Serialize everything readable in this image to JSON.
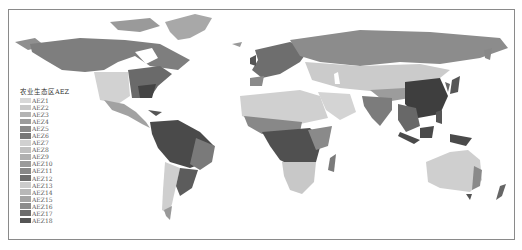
{
  "map": {
    "title": "",
    "type": "world-choropleth",
    "legend": {
      "title": "农业生态区AEZ",
      "items": [
        {
          "label": "AEZ1",
          "color": "#d8d8d8"
        },
        {
          "label": "AEZ2",
          "color": "#c8c8c8"
        },
        {
          "label": "AEZ3",
          "color": "#b4b4b4"
        },
        {
          "label": "AEZ4",
          "color": "#9c9c9c"
        },
        {
          "label": "AEZ5",
          "color": "#8a8a8a"
        },
        {
          "label": "AEZ6",
          "color": "#787878"
        },
        {
          "label": "AEZ7",
          "color": "#d0d0d0"
        },
        {
          "label": "AEZ8",
          "color": "#c0c0c0"
        },
        {
          "label": "AEZ9",
          "color": "#b0b0b0"
        },
        {
          "label": "AEZ10",
          "color": "#9a9a9a"
        },
        {
          "label": "AEZ11",
          "color": "#888888"
        },
        {
          "label": "AEZ12",
          "color": "#6e6e6e"
        },
        {
          "label": "AEZ13",
          "color": "#cccccc"
        },
        {
          "label": "AEZ14",
          "color": "#b8b8b8"
        },
        {
          "label": "AEZ15",
          "color": "#a4a4a4"
        },
        {
          "label": "AEZ16",
          "color": "#8c8c8c"
        },
        {
          "label": "AEZ17",
          "color": "#6c6c6c"
        },
        {
          "label": "AEZ18",
          "color": "#555555"
        }
      ]
    }
  }
}
